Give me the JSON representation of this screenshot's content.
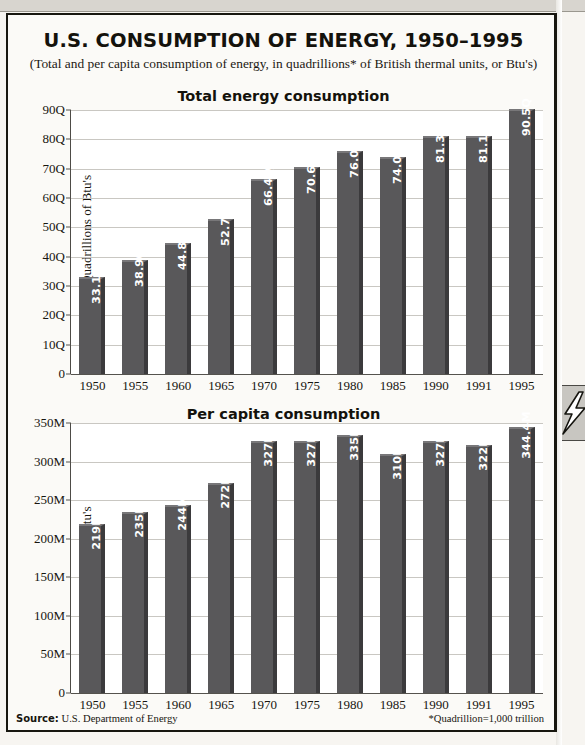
{
  "page": {
    "title": "U.S. CONSUMPTION OF ENERGY, 1950–1995",
    "subtitle": "(Total and per capita consumption of energy, in quadrillions* of British thermal units, or Btu's)",
    "source_label": "Source:",
    "source_value": "U.S. Department of Energy",
    "footnote": "*Quadrillion=1,000 trillion",
    "tab_icon": "lightning-bolt-icon",
    "colors": {
      "bar_face": "#59585a",
      "bar_side": "#3b3a3c",
      "bar_top": "#787779",
      "grid": "#c9c7c2",
      "axis": "#55534e",
      "paper": "#fbfaf7",
      "ink": "#14120c"
    }
  },
  "chart_data": [
    {
      "type": "bar",
      "title": "Total energy consumption",
      "xlabel": "",
      "ylabel": "Quadrillions of Btu's",
      "categories": [
        "1950",
        "1955",
        "1960",
        "1965",
        "1970",
        "1975",
        "1980",
        "1985",
        "1990",
        "1991",
        "1995"
      ],
      "values": [
        33.1,
        38.9,
        44.8,
        52.7,
        66.4,
        70.6,
        76.0,
        74.0,
        81.3,
        81.1,
        90.5
      ],
      "value_labels": [
        "33.1Q",
        "38.9Q",
        "44.8Q",
        "52.7Q",
        "66.4Q",
        "70.6Q",
        "76.0Q",
        "74.0Q",
        "81.3Q",
        "81.1Q",
        "90.5Q"
      ],
      "ylim": [
        0,
        90
      ],
      "yticks": [
        0,
        10,
        20,
        30,
        40,
        50,
        60,
        70,
        80,
        90
      ],
      "ytick_labels": [
        "0",
        "10Q",
        "20Q",
        "30Q",
        "40Q",
        "50Q",
        "60Q",
        "70Q",
        "80Q",
        "90Q"
      ],
      "grid": true,
      "legend": "none"
    },
    {
      "type": "bar",
      "title": "Per capita consumption",
      "xlabel": "",
      "ylabel": "Mllions of Btu's",
      "categories": [
        "1950",
        "1955",
        "1960",
        "1965",
        "1970",
        "1975",
        "1980",
        "1985",
        "1990",
        "1991",
        "1995"
      ],
      "values": [
        219,
        235,
        244,
        272,
        327,
        327,
        335,
        310,
        327,
        322,
        344.4
      ],
      "value_labels": [
        "219M",
        "235M",
        "244M",
        "272M",
        "327M",
        "327M",
        "335M",
        "310M",
        "327M",
        "322M",
        "344.4M"
      ],
      "ylim": [
        0,
        350
      ],
      "yticks": [
        0,
        50,
        100,
        150,
        200,
        250,
        300,
        350
      ],
      "ytick_labels": [
        "0",
        "50M",
        "100M",
        "150M",
        "200M",
        "250M",
        "300M",
        "350M"
      ],
      "grid": true,
      "legend": "none"
    }
  ]
}
